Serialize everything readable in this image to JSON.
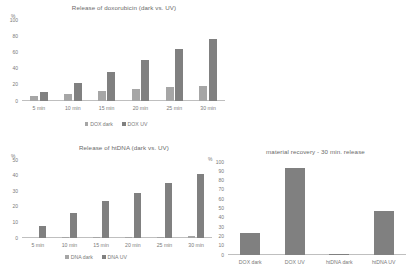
{
  "figure": {
    "axis_unit_label": "%",
    "panel_count": 3
  },
  "chart_data": [
    {
      "id": "dox-release",
      "type": "bar",
      "title": "Release of doxorubicin (dark vs. UV)",
      "xlabel": "",
      "ylabel": "%",
      "ylim": [
        0,
        100
      ],
      "yticks": [
        0,
        20,
        40,
        60,
        80,
        100
      ],
      "categories": [
        "5 min",
        "10 min",
        "15 min",
        "20 min",
        "25 min",
        "30 min"
      ],
      "grid": false,
      "legend_position": "bottom",
      "series": [
        {
          "name": "DOX dark",
          "color": "#a6a6a6",
          "values": [
            6,
            9,
            12,
            15,
            17,
            19
          ]
        },
        {
          "name": "DOX UV",
          "color": "#808080",
          "values": [
            11,
            22,
            36,
            51,
            64,
            76
          ]
        }
      ]
    },
    {
      "id": "htdna-release",
      "type": "bar",
      "title": "Release of htDNA (dark vs. UV)",
      "xlabel": "",
      "ylabel": "%",
      "ylim": [
        0,
        50
      ],
      "yticks": [
        0,
        10,
        20,
        30,
        40,
        50
      ],
      "categories": [
        "5 min",
        "10 min",
        "15 min",
        "20 min",
        "25 min",
        "30 min"
      ],
      "grid": false,
      "legend_position": "bottom",
      "series": [
        {
          "name": "DNA dark",
          "color": "#a6a6a6",
          "values": [
            0,
            0.2,
            0.3,
            0.5,
            0.7,
            1
          ]
        },
        {
          "name": "DNA UV",
          "color": "#808080",
          "values": [
            8,
            16,
            24,
            29,
            35,
            41
          ]
        }
      ]
    },
    {
      "id": "material-recovery",
      "type": "bar",
      "title": "material recovery - 30 min. release",
      "xlabel": "",
      "ylabel": "%",
      "ylim": [
        0,
        100
      ],
      "yticks": [
        0,
        10,
        20,
        30,
        40,
        50,
        60,
        70,
        80,
        90,
        100
      ],
      "categories": [
        "DOX dark",
        "DOX UV",
        "htDNA dark",
        "htDNA UV"
      ],
      "grid": false,
      "legend_position": "none",
      "series": [
        {
          "name": "recovery",
          "color": "#808080",
          "values": [
            24,
            94,
            0.6,
            47
          ]
        }
      ]
    }
  ]
}
